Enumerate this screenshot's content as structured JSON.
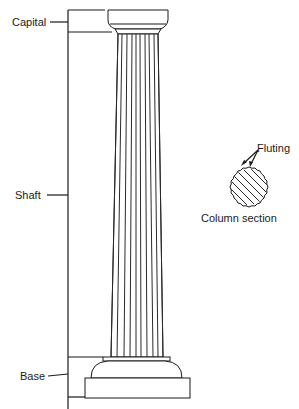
{
  "labels": {
    "capital": "Capital",
    "shaft": "Shaft",
    "base": "Base",
    "fluting": "Fluting",
    "column_section": "Column section"
  },
  "colors": {
    "ink": "#1a1a1a",
    "background": "#ffffff"
  }
}
